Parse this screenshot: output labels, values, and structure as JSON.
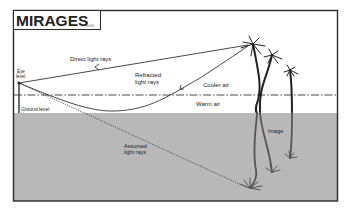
{
  "title": "MIRAGES",
  "title_ref": "ref 00",
  "labels": {
    "eye_level_1": "Eye",
    "eye_level_2": "level",
    "ground_level": "Ground level",
    "direct_rays": "Direct light rays",
    "refracted_1": "Refracted",
    "refracted_2": "light rays",
    "cooler_air": "Cooler air",
    "warm_air": "Warm air",
    "image": "Image",
    "assumed_1": "Assumed",
    "assumed_2": "light rays"
  },
  "colors": {
    "frame": "#2a2a2a",
    "ground": "#b8b8b8",
    "line": "#333333",
    "text": "#222222"
  }
}
